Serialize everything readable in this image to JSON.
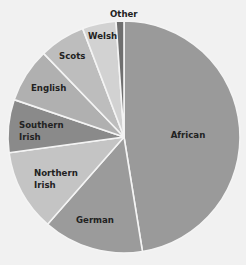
{
  "chart_data": {
    "type": "pie",
    "title": "",
    "start_angle_deg": 0,
    "direction": "clockwise",
    "center": [
      124,
      137
    ],
    "radius": 116,
    "separator_color": "#f4f4f4",
    "slices": [
      {
        "label": "African",
        "value": 47.5,
        "color": "#9a9a9a",
        "label_lines": [
          "African"
        ],
        "label_pos": [
          188,
          138
        ]
      },
      {
        "label": "German",
        "value": 14.0,
        "color": "#9b9b9b",
        "label_lines": [
          "German"
        ],
        "label_pos": [
          95,
          223
        ]
      },
      {
        "label": "Northern Irish",
        "value": 11.4,
        "color": "#c4c4c4",
        "label_lines": [
          "Northern",
          "Irish"
        ],
        "label_pos": [
          34,
          176
        ]
      },
      {
        "label": "Southern Irish",
        "value": 7.4,
        "color": "#8a8a8a",
        "label_lines": [
          "Southern",
          "Irish"
        ],
        "label_pos": [
          19,
          128
        ]
      },
      {
        "label": "English",
        "value": 7.6,
        "color": "#b0b0b0",
        "label_lines": [
          "English"
        ],
        "label_pos": [
          31,
          91
        ]
      },
      {
        "label": "Scots",
        "value": 6.4,
        "color": "#bdbdbd",
        "label_lines": [
          "Scots"
        ],
        "label_pos": [
          59,
          59
        ]
      },
      {
        "label": "Welsh",
        "value": 4.7,
        "color": "#d2d2d2",
        "label_lines": [
          "Welsh"
        ],
        "label_pos": [
          88,
          39
        ]
      },
      {
        "label": "Other",
        "value": 1.1,
        "color": "#6f6f6f",
        "label_lines": [
          "Other"
        ],
        "label_pos": [
          110,
          17
        ]
      }
    ],
    "legend": null,
    "grid": false
  }
}
